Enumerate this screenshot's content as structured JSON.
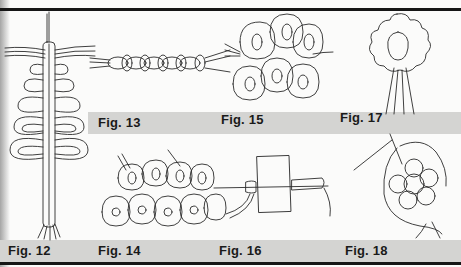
{
  "document": {
    "type": "lace-tatting instruction illustrations",
    "figures": [
      {
        "id": "fig12",
        "label": "Fig. 12",
        "subject": "needle with tatted spine and looped picots"
      },
      {
        "id": "fig13",
        "label": "Fig. 13",
        "subject": "tatted chain between threads"
      },
      {
        "id": "fig15",
        "label": "Fig. 15",
        "subject": "tatted lace motif grid"
      },
      {
        "id": "fig17",
        "label": "Fig. 17",
        "subject": "tatted flower medallion with thread tails"
      },
      {
        "id": "fig14",
        "label": "Fig. 14",
        "subject": "tatted lace rows of rings"
      },
      {
        "id": "fig16",
        "label": "Fig. 16",
        "subject": "needle through card with wrapped stitches"
      },
      {
        "id": "fig18",
        "label": "Fig. 18",
        "subject": "needle joining a tatted round motif"
      }
    ]
  },
  "colors": {
    "paper": "#fbfbfa",
    "label_bar": "#d4d4d2",
    "ink": "#1a1a1a",
    "rule": "#161616"
  }
}
